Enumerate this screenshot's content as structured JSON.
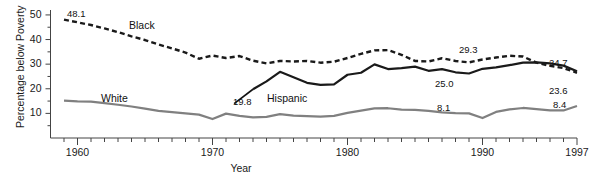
{
  "chart_data": {
    "type": "line",
    "title": "",
    "xlabel": "Year",
    "ylabel": "Percentage below Poverty",
    "xlim": [
      1958,
      1997
    ],
    "ylim": [
      0,
      52
    ],
    "grid": false,
    "legend_position": "inline-labels",
    "x_ticks_major": [
      1960,
      1970,
      1980,
      1990,
      1997
    ],
    "x_tick_labels": [
      "1960",
      "1970",
      "1980",
      "1990",
      "1997"
    ],
    "x_minor_tick_interval": 1,
    "y_ticks_major": [
      10,
      20,
      30,
      40,
      50
    ],
    "y_tick_labels": [
      "10",
      "20",
      "30",
      "40",
      "50"
    ],
    "y_minor_tick_interval": 5,
    "series": [
      {
        "name": "Black",
        "style": "dashed",
        "color": "#1a1a1a",
        "x": [
          1959,
          1960,
          1961,
          1962,
          1963,
          1964,
          1965,
          1966,
          1967,
          1968,
          1969,
          1970,
          1971,
          1972,
          1973,
          1974,
          1975,
          1976,
          1977,
          1978,
          1979,
          1980,
          1981,
          1982,
          1983,
          1984,
          1985,
          1986,
          1987,
          1988,
          1989,
          1990,
          1991,
          1992,
          1993,
          1994,
          1995,
          1996,
          1997
        ],
        "values": [
          48.1,
          47.0,
          45.9,
          44.5,
          43.0,
          41.3,
          39.8,
          38.0,
          36.4,
          34.7,
          32.2,
          33.5,
          32.5,
          33.3,
          31.4,
          30.3,
          31.3,
          31.1,
          31.3,
          30.6,
          31.0,
          32.5,
          34.2,
          35.6,
          35.7,
          33.8,
          31.3,
          31.1,
          32.4,
          31.3,
          30.7,
          31.9,
          32.7,
          33.4,
          33.1,
          30.6,
          29.3,
          28.4,
          26.5
        ],
        "endpoint_labels": [
          {
            "label": "48.1",
            "x": 1959,
            "value": 48.1
          },
          {
            "label": "29.3",
            "x": 1995,
            "value": 29.3
          },
          {
            "label": "24.7",
            "x": 1997,
            "value": 26.5
          }
        ]
      },
      {
        "name": "Hispanic",
        "style": "solid",
        "color": "#1a1a1a",
        "x": [
          1973,
          1974,
          1975,
          1976,
          1977,
          1978,
          1979,
          1980,
          1981,
          1982,
          1983,
          1984,
          1985,
          1986,
          1987,
          1988,
          1989,
          1990,
          1991,
          1992,
          1993,
          1994,
          1995,
          1996,
          1997
        ],
        "values": [
          19.8,
          23.0,
          26.9,
          24.7,
          22.4,
          21.6,
          21.8,
          25.7,
          26.5,
          29.9,
          28.0,
          28.4,
          29.0,
          27.3,
          28.0,
          26.7,
          26.2,
          28.1,
          28.7,
          29.6,
          30.6,
          30.7,
          30.3,
          29.4,
          27.1
        ],
        "endpoint_labels": [
          {
            "label": "19.8",
            "x": 1973,
            "value": 19.8
          },
          {
            "label": "25.0",
            "x": 1989,
            "value": 26.2
          },
          {
            "label": "23.6",
            "x": 1997,
            "value": 27.1
          }
        ]
      },
      {
        "name": "White",
        "style": "solid",
        "color": "#808080",
        "x": [
          1959,
          1960,
          1961,
          1962,
          1963,
          1964,
          1965,
          1966,
          1967,
          1968,
          1969,
          1970,
          1971,
          1972,
          1973,
          1974,
          1975,
          1976,
          1977,
          1978,
          1979,
          1980,
          1981,
          1982,
          1983,
          1984,
          1985,
          1986,
          1987,
          1988,
          1989,
          1990,
          1991,
          1992,
          1993,
          1994,
          1995,
          1996,
          1997
        ],
        "values": [
          15.2,
          14.9,
          14.8,
          14.2,
          13.5,
          12.8,
          11.9,
          11.0,
          10.5,
          10.0,
          9.5,
          7.7,
          9.9,
          9.0,
          8.4,
          8.6,
          9.7,
          9.1,
          8.9,
          8.7,
          9.0,
          10.2,
          11.1,
          12.0,
          12.1,
          11.5,
          11.4,
          11.0,
          10.4,
          10.1,
          10.0,
          8.1,
          10.6,
          11.6,
          12.2,
          11.7,
          11.2,
          11.2,
          13.0
        ],
        "endpoint_labels": [
          {
            "label": "15.2",
            "x": 1959,
            "value": 15.2
          },
          {
            "label": "8.1",
            "x": 1990,
            "value": 8.1
          },
          {
            "label": "8.4",
            "x": 1997,
            "value": 13.0
          }
        ]
      }
    ],
    "series_labels": [
      {
        "text": "Black",
        "x_px": 129,
        "y_px": 19
      },
      {
        "text": "Hispanic",
        "x_px": 267,
        "y_px": 92
      },
      {
        "text": "White",
        "x_px": 101,
        "y_px": 92
      }
    ],
    "value_annotations": [
      {
        "text": "48.1",
        "x_px": 67,
        "y_px": 8
      },
      {
        "text": "29.3",
        "x_px": 459,
        "y_px": 44
      },
      {
        "text": "24.7",
        "x_px": 549,
        "y_px": 57
      },
      {
        "text": "19.8",
        "x_px": 233,
        "y_px": 96
      },
      {
        "text": "25.0",
        "x_px": 435,
        "y_px": 78
      },
      {
        "text": "23.6",
        "x_px": 549,
        "y_px": 85
      },
      {
        "text": "8.1",
        "x_px": 437,
        "y_px": 102
      },
      {
        "text": "8.4",
        "x_px": 553,
        "y_px": 99
      }
    ]
  }
}
